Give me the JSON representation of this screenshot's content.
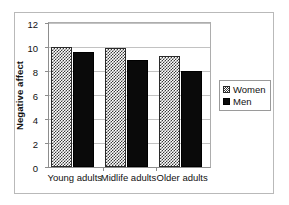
{
  "chart_data": {
    "type": "bar",
    "title": "",
    "subtitle": "",
    "xlabel": "",
    "ylabel": "Negative affect",
    "categories": [
      "Young adults",
      "Midlife adults",
      "Older adults"
    ],
    "series": [
      {
        "name": "Women",
        "values": [
          10.0,
          9.9,
          9.25
        ],
        "pattern": "checkered-hatch",
        "color": "#3a3a3a"
      },
      {
        "name": "Men",
        "values": [
          9.6,
          8.9,
          8.0
        ],
        "pattern": "solid",
        "color": "#0a0a0a"
      }
    ],
    "ylim": [
      0,
      12
    ],
    "yticks": [
      0,
      2,
      4,
      6,
      8,
      10,
      12
    ],
    "ytick_labels": [
      "0",
      "2",
      "4",
      "6",
      "8",
      "10",
      "12"
    ],
    "grid": true,
    "grid_axis": "y",
    "legend_position": "right-outside",
    "legend_entries": [
      "Women",
      "Men"
    ]
  },
  "axes": {
    "y_title": "Negative affect",
    "y_tick_labels": [
      "12",
      "10",
      "8",
      "6",
      "4",
      "2",
      "0"
    ],
    "x_categories": [
      "Young adults",
      "Midlife adults",
      "Older adults"
    ]
  },
  "legend": {
    "items": [
      {
        "label": "Women"
      },
      {
        "label": "Men"
      }
    ]
  },
  "colors": {
    "frame": "#b9b9b9",
    "axis": "#8d8d8d",
    "grid": "#c2c2c2",
    "women_bar": "#3a3a3a",
    "men_bar": "#0a0a0a",
    "text": "#111111"
  }
}
